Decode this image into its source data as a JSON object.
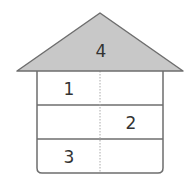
{
  "diagram": {
    "type": "number-house",
    "roof": {
      "value": "4",
      "fill": "#c8c8c8",
      "stroke": "#6e6e6e"
    },
    "rows": [
      {
        "left": "1",
        "right": ""
      },
      {
        "left": "",
        "right": "2"
      },
      {
        "left": "3",
        "right": ""
      }
    ],
    "colors": {
      "line": "#6e6e6e",
      "divider": "#9a9a9a",
      "text": "#333333"
    }
  }
}
